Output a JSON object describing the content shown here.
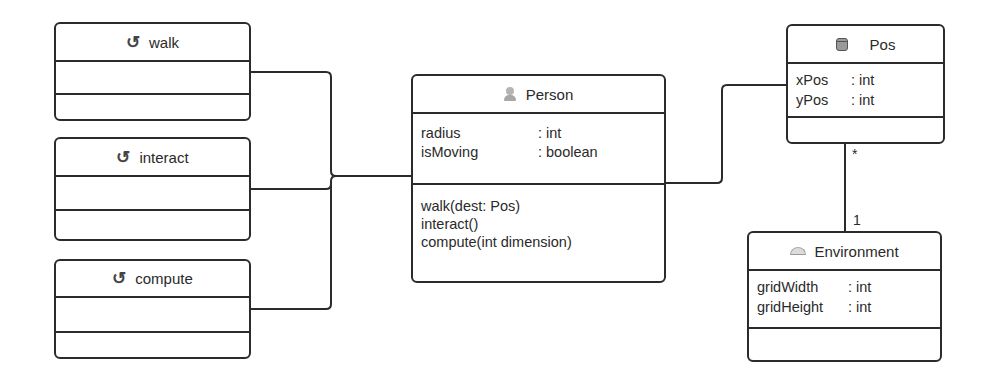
{
  "diagram": {
    "type": "UML class diagram",
    "interfaces": [
      {
        "name": "walk",
        "icon": "interface-icon",
        "attributes": [],
        "operations": []
      },
      {
        "name": "interact",
        "icon": "interface-icon",
        "attributes": [],
        "operations": []
      },
      {
        "name": "compute",
        "icon": "interface-icon",
        "attributes": [],
        "operations": []
      }
    ],
    "classes": {
      "person": {
        "name": "Person",
        "icon": "person-icon",
        "attributes": [
          {
            "name": "radius",
            "type": ": int"
          },
          {
            "name": "isMoving",
            "type": ": boolean"
          }
        ],
        "operations": [
          "walk(dest: Pos)",
          "interact()",
          "compute(int dimension)"
        ]
      },
      "pos": {
        "name": "Pos",
        "icon": "database-icon",
        "attributes": [
          {
            "name": "xPos",
            "type": ": int"
          },
          {
            "name": "yPos",
            "type": ": int"
          }
        ],
        "operations": []
      },
      "environment": {
        "name": "Environment",
        "icon": "dome-icon",
        "attributes": [
          {
            "name": "gridWidth",
            "type": ": int"
          },
          {
            "name": "gridHeight",
            "type": ": int"
          }
        ],
        "operations": []
      }
    },
    "associations": [
      {
        "from": "walk",
        "to": "Person"
      },
      {
        "from": "interact",
        "to": "Person"
      },
      {
        "from": "compute",
        "to": "Person"
      },
      {
        "from": "Person",
        "to": "Pos"
      },
      {
        "from": "Pos",
        "to": "Environment",
        "from_multiplicity": "*",
        "to_multiplicity": "1"
      }
    ],
    "multiplicities": {
      "pos_end": "*",
      "environment_end": "1"
    },
    "colors": {
      "line": "#2b2b2b",
      "text": "#2a2a2a",
      "background": "#ffffff"
    }
  }
}
